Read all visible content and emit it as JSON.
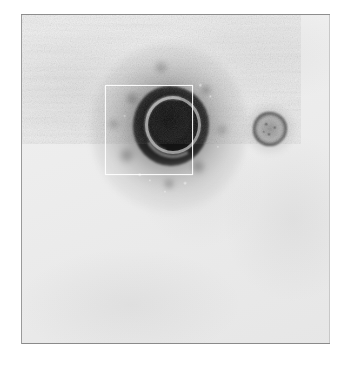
{
  "figure": {
    "kind": "transmission-electron-micrograph",
    "caption": "",
    "background_color": "#ffffff"
  },
  "plate": {
    "left": 21,
    "top": 14,
    "width": 309,
    "height": 330,
    "emulsion_color": "#ececec",
    "border_color": "#8d8d8d",
    "grain": "film-grain-noise"
  },
  "specimens": [
    {
      "name": "large-enveloped-virion",
      "center_x": 148,
      "center_y": 130,
      "halo_diameter": 118,
      "body_diameter": 74,
      "capsid_ring_diameter": 44,
      "core_color": "#141414",
      "body_color": "#2a2a2a",
      "halo_color": "#9a9a9a",
      "capsid_ring_color": "#b9b9b9"
    },
    {
      "name": "small-dense-particle",
      "center_x": 268,
      "center_y": 127,
      "halo_diameter": 46,
      "body_diameter": 34,
      "rim_color": "#1c1c1c",
      "interior_color": "#6e6e6e",
      "halo_color": "#b4b4b4"
    }
  ],
  "overlay": {
    "name": "selection-square",
    "left": 105,
    "top": 85,
    "width": 86,
    "height": 88,
    "stroke_color": "#ffffff",
    "stroke_width": 1
  },
  "annotations": {
    "scale_bar": "",
    "labels": []
  }
}
